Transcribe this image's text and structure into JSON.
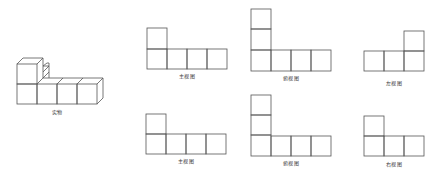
{
  "figure": {
    "object_label": "实物",
    "views": [
      {
        "id": "front-view-1",
        "label": "主视图"
      },
      {
        "id": "top-view-1",
        "label": "俯视图"
      },
      {
        "id": "left-view",
        "label": "左视图"
      },
      {
        "id": "front-view-2",
        "label": "主视图"
      },
      {
        "id": "top-view-2",
        "label": "俯视图"
      },
      {
        "id": "right-view",
        "label": "右视图"
      }
    ],
    "stroke_color": "#555555",
    "background": "#ffffff"
  }
}
